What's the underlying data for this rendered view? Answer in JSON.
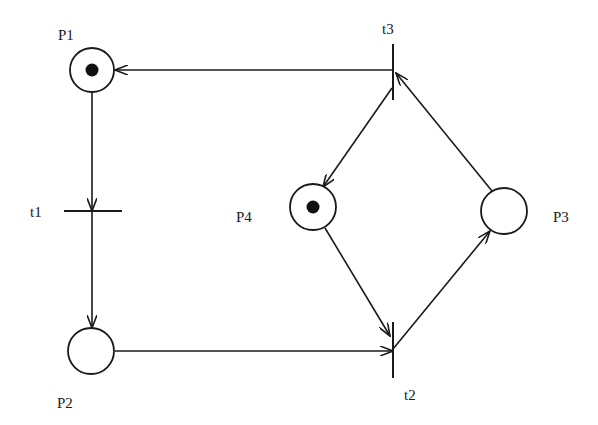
{
  "diagram": {
    "type": "petri-net",
    "colors": {
      "stroke": "#1a1a1a",
      "background": "#ffffff",
      "token": "#111111"
    },
    "places": [
      {
        "id": "P1",
        "label": "P1",
        "cx": 92,
        "cy": 70,
        "r": 22,
        "tokens": 1,
        "label_x": 58,
        "label_y": 40
      },
      {
        "id": "P2",
        "label": "P2",
        "cx": 91,
        "cy": 351,
        "r": 23,
        "tokens": 0,
        "label_x": 57,
        "label_y": 408
      },
      {
        "id": "P3",
        "label": "P3",
        "cx": 504,
        "cy": 211,
        "r": 23,
        "tokens": 0,
        "label_x": 553,
        "label_y": 222
      },
      {
        "id": "P4",
        "label": "P4",
        "cx": 313,
        "cy": 207,
        "r": 23,
        "tokens": 1,
        "label_x": 236,
        "label_y": 222
      }
    ],
    "transitions": [
      {
        "id": "t1",
        "label": "t1",
        "orientation": "horizontal",
        "x1": 64,
        "y1": 211,
        "x2": 122,
        "y2": 211,
        "label_x": 30,
        "label_y": 217
      },
      {
        "id": "t2",
        "label": "t2",
        "orientation": "vertical",
        "x1": 393,
        "y1": 322,
        "x2": 393,
        "y2": 378,
        "label_x": 404,
        "label_y": 400
      },
      {
        "id": "t3",
        "label": "t3",
        "orientation": "vertical",
        "x1": 393,
        "y1": 44,
        "x2": 393,
        "y2": 100,
        "label_x": 382,
        "label_y": 34
      }
    ],
    "arcs": [
      {
        "from": "P1",
        "to": "t1",
        "x1": 92,
        "y1": 92,
        "x2": 92,
        "y2": 211
      },
      {
        "from": "t1",
        "to": "P2",
        "x1": 92,
        "y1": 211,
        "x2": 92,
        "y2": 328
      },
      {
        "from": "P2",
        "to": "t2",
        "x1": 115,
        "y1": 351,
        "x2": 393,
        "y2": 351
      },
      {
        "from": "P4",
        "to": "t2",
        "x1": 325,
        "y1": 228,
        "x2": 390,
        "y2": 336
      },
      {
        "from": "t2",
        "to": "P3",
        "x1": 393,
        "y1": 349,
        "x2": 490,
        "y2": 231
      },
      {
        "from": "P3",
        "to": "t3",
        "x1": 492,
        "y1": 191,
        "x2": 396,
        "y2": 73
      },
      {
        "from": "t3",
        "to": "P4",
        "x1": 392,
        "y1": 88,
        "x2": 323,
        "y2": 187
      },
      {
        "from": "t3",
        "to": "P1",
        "x1": 393,
        "y1": 70,
        "x2": 115,
        "y2": 70
      }
    ]
  }
}
